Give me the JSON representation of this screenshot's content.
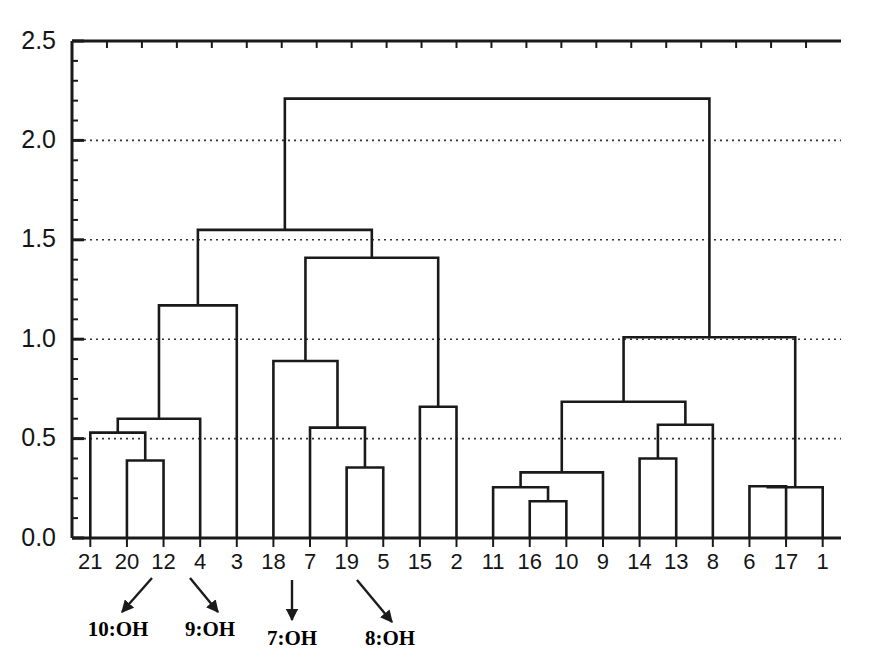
{
  "figure": {
    "kind": "dendrogram",
    "background": "#ffffff",
    "line_color": "#1a1a1a",
    "grid_color": "#333333"
  },
  "chart_data": {
    "type": "line",
    "subtype": "dendrogram",
    "title": "",
    "xlabel": "",
    "ylabel": "",
    "ylim": [
      0.0,
      2.5
    ],
    "yticks": [
      "0.0",
      "0.5",
      "1.0",
      "1.5",
      "2.0",
      "2.5"
    ],
    "ytick_values": [
      0.0,
      0.5,
      1.0,
      1.5,
      2.0,
      2.5
    ],
    "y_minor_tick_step": 0.1,
    "grid": "horizontal-dotted-at-major-ticks",
    "legend": "none",
    "leaf_order": [
      "21",
      "20",
      "12",
      "4",
      "3",
      "18",
      "7",
      "19",
      "5",
      "15",
      "2",
      "11",
      "16",
      "10",
      "9",
      "14",
      "13",
      "8",
      "6",
      "17",
      "1"
    ],
    "leaf_count": 21,
    "merges": [
      {
        "id": "m1",
        "left": "20",
        "right": "12",
        "height": 0.39
      },
      {
        "id": "m2",
        "left": "21",
        "right": "m1",
        "height": 0.53
      },
      {
        "id": "m3",
        "left": "m2",
        "right": "4",
        "height": 0.6
      },
      {
        "id": "m4",
        "left": "m3",
        "right": "3",
        "height": 1.17
      },
      {
        "id": "m5",
        "left": "19",
        "right": "5",
        "height": 0.355
      },
      {
        "id": "m6",
        "left": "7",
        "right": "m5",
        "height": 0.555
      },
      {
        "id": "m7",
        "left": "18",
        "right": "m6",
        "height": 0.89
      },
      {
        "id": "m8",
        "left": "15",
        "right": "2",
        "height": 0.66
      },
      {
        "id": "m9",
        "left": "m7",
        "right": "m8",
        "height": 1.41
      },
      {
        "id": "m10",
        "left": "m4",
        "right": "m9",
        "height": 1.55
      },
      {
        "id": "m11",
        "left": "16",
        "right": "10",
        "height": 0.185
      },
      {
        "id": "m12",
        "left": "11",
        "right": "m11",
        "height": 0.255
      },
      {
        "id": "m13",
        "left": "m12",
        "right": "9",
        "height": 0.33
      },
      {
        "id": "m14",
        "left": "14",
        "right": "13",
        "height": 0.4
      },
      {
        "id": "m15",
        "left": "m14",
        "right": "8",
        "height": 0.57
      },
      {
        "id": "m16",
        "left": "m13",
        "right": "m15",
        "height": 0.685
      },
      {
        "id": "m17",
        "left": "6",
        "right": "17",
        "height": 0.26
      },
      {
        "id": "m18",
        "left": "m17",
        "right": "1",
        "height": 0.255
      },
      {
        "id": "m19",
        "left": "m16",
        "right": "m18",
        "height": 1.01
      },
      {
        "id": "m20",
        "left": "m10",
        "right": "m19",
        "height": 2.21
      }
    ],
    "annotations": [
      {
        "label": "10:OH",
        "target_leaf": "21",
        "label_x": 118,
        "label_y": 636,
        "arrow_from_x": 152,
        "arrow_from_y": 578,
        "arrow_to_x": 122,
        "arrow_to_y": 612
      },
      {
        "label": "9:OH",
        "target_leaf": "20",
        "label_x": 210,
        "label_y": 636,
        "arrow_from_x": 190,
        "arrow_from_y": 578,
        "arrow_to_x": 218,
        "arrow_to_y": 612
      },
      {
        "label": "7:OH",
        "target_leaf": "18",
        "label_x": 292,
        "label_y": 645,
        "arrow_from_x": 292,
        "arrow_from_y": 580,
        "arrow_to_x": 292,
        "arrow_to_y": 620
      },
      {
        "label": "8:OH",
        "target_leaf": "19",
        "label_x": 390,
        "label_y": 645,
        "arrow_from_x": 357,
        "arrow_from_y": 580,
        "arrow_to_x": 392,
        "arrow_to_y": 622
      }
    ]
  }
}
